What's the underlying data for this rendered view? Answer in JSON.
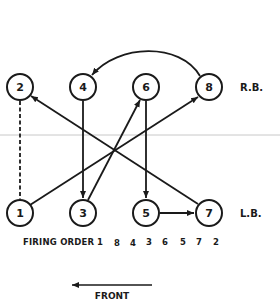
{
  "diagram": {
    "type": "engine-firing-order",
    "colors": {
      "ink": "#1a1a1a",
      "background": "#ffffff",
      "scan_line": "#c8c8c8"
    },
    "banks": {
      "right": {
        "label": "R.B.",
        "cylinders": [
          "2",
          "4",
          "6",
          "8"
        ]
      },
      "left": {
        "label": "L.B.",
        "cylinders": [
          "1",
          "3",
          "5",
          "7"
        ]
      }
    },
    "cylinders": {
      "c1": "1",
      "c2": "2",
      "c3": "3",
      "c4": "4",
      "c5": "5",
      "c6": "6",
      "c7": "7",
      "c8": "8"
    },
    "firing_order": {
      "label": "FIRING ORDER",
      "sequence": [
        "1",
        "8",
        "4",
        "3",
        "6",
        "5",
        "7",
        "2"
      ]
    },
    "connections": [
      {
        "from": "1",
        "to": "8",
        "style": "arrow"
      },
      {
        "from": "8",
        "to": "4",
        "style": "curved-arrow"
      },
      {
        "from": "4",
        "to": "3",
        "style": "arrow"
      },
      {
        "from": "3",
        "to": "6",
        "style": "arrow"
      },
      {
        "from": "6",
        "to": "5",
        "style": "arrow"
      },
      {
        "from": "5",
        "to": "7",
        "style": "arrow"
      },
      {
        "from": "7",
        "to": "2",
        "style": "arrow"
      },
      {
        "from": "2",
        "to": "1",
        "style": "dashed"
      }
    ],
    "front": {
      "label": "FRONT",
      "direction": "left"
    }
  }
}
